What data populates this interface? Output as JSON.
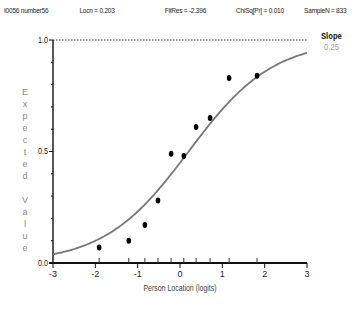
{
  "header": {
    "item_id": "I0056 number56",
    "locn": "Locn = 0.203",
    "fitres": "FitRes = -2.396",
    "chisq": "ChiSq[Pr] = 0.010",
    "samplen": "SampleN = 833"
  },
  "slope": {
    "label": "Slope",
    "value": "0.25"
  },
  "axes": {
    "ylabel": "Expected Value",
    "xlabel": "Person Location (logits)",
    "yticks": [
      "0.0",
      "0.5",
      "1.0"
    ],
    "xticks": [
      "-3",
      "-2",
      "-1",
      "0",
      "1",
      "2",
      "3"
    ]
  },
  "chart_data": {
    "type": "scatter",
    "xlabel": "Person Location (logits)",
    "ylabel": "Expected Value",
    "xlim": [
      -3,
      3
    ],
    "ylim": [
      0,
      1
    ],
    "x_ticks": [
      -3,
      -2,
      -1,
      0,
      1,
      2,
      3
    ],
    "y_ticks": [
      0.0,
      0.5,
      1.0
    ],
    "y_minor_tick_step": 0.1,
    "grid": false,
    "reference_line": {
      "y": 1.0,
      "style": "dotted"
    },
    "series": [
      {
        "name": "Observed class means",
        "kind": "scatter",
        "x": [
          -1.91,
          -1.21,
          -0.83,
          -0.52,
          -0.21,
          0.09,
          0.38,
          0.71,
          1.16,
          1.82
        ],
        "y": [
          0.07,
          0.1,
          0.17,
          0.28,
          0.49,
          0.48,
          0.61,
          0.65,
          0.83,
          0.84
        ]
      },
      {
        "name": "Expected value curve (ICC)",
        "kind": "line",
        "location": 0.203,
        "slope": 0.25,
        "x": [
          -3,
          -2,
          -1,
          -0.5,
          0,
          0.5,
          1,
          2,
          3
        ],
        "y": [
          0.04,
          0.1,
          0.23,
          0.33,
          0.45,
          0.57,
          0.69,
          0.85,
          0.93
        ]
      }
    ],
    "annotations": [
      {
        "text": "Slope",
        "value": "0.25"
      }
    ]
  }
}
